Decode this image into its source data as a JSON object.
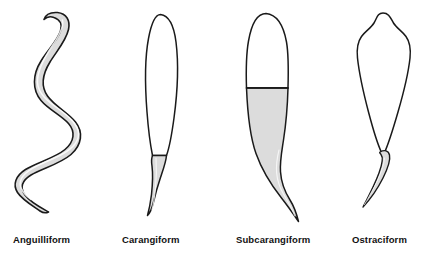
{
  "figure": {
    "background_color": "#ffffff",
    "outline_color": "#1a1a1a",
    "shade_color": "#dcdcdc",
    "label_color": "#111111"
  },
  "forms": [
    {
      "id": "anguilliform",
      "label": "Anguilliform",
      "label_x": 13,
      "label_y": 243,
      "shading": "entire-body",
      "description": "Sinuous S-shaped eel-like body of uniform thickness, shaded along full length, tapering to a fine tail point"
    },
    {
      "id": "carangiform",
      "label": "Carangiform",
      "label_x": 122,
      "label_y": 243,
      "shading": "tail-base-only",
      "description": "Long narrow unshaded oval body with a small shaded wedge at the tail base and a thin curving tail"
    },
    {
      "id": "subcarangiform",
      "label": "Subcarangiform",
      "label_x": 236,
      "label_y": 243,
      "shading": "posterior-half",
      "description": "Unshaded head and forebody above a horizontal divider, broad shaded tapering posterior sweeping into a long curved tail"
    },
    {
      "id": "ostraciform",
      "label": "Ostraciform",
      "label_x": 352,
      "label_y": 243,
      "shading": "tail-node-only",
      "description": "Wide rigid kite-shaped unshaded body with a notched snout and a tiny shaded node joining a short hooked tail"
    }
  ]
}
